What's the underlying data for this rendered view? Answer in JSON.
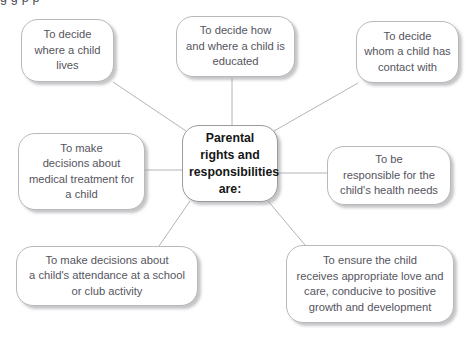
{
  "diagram": {
    "clipped_header_text": "g g p p",
    "center": {
      "id": "center",
      "label": "Parental\nrights and\nresponsibilities\nare:",
      "x": 182,
      "y": 125,
      "width": 96,
      "height": 77
    },
    "nodes": [
      {
        "id": "decide-where-child-lives",
        "label": "To decide\nwhere a child\nlives",
        "x": 21,
        "y": 19,
        "width": 93,
        "height": 63
      },
      {
        "id": "decide-how-where-educated",
        "label": "To decide how\nand where a child is\neducated",
        "x": 176,
        "y": 16,
        "width": 119,
        "height": 61
      },
      {
        "id": "decide-contact-with",
        "label": "To decide\nwhom a child has\ncontact with",
        "x": 356,
        "y": 21,
        "width": 103,
        "height": 62
      },
      {
        "id": "medical-treatment-decisions",
        "label": "To make\ndecisions about\nmedical treatment for\na child",
        "x": 18,
        "y": 133,
        "width": 127,
        "height": 77
      },
      {
        "id": "responsible-health-needs",
        "label": "To be\nresponsible for the\nchild's health needs",
        "x": 327,
        "y": 146,
        "width": 124,
        "height": 59
      },
      {
        "id": "school-club-attendance",
        "label": "To make decisions about\na child's attendance at a school\nor club activity",
        "x": 16,
        "y": 246,
        "width": 182,
        "height": 60
      },
      {
        "id": "ensure-love-and-care",
        "label": "To ensure the child\nreceives appropriate love and\ncare, conducive to positive\ngrowth and development",
        "x": 286,
        "y": 245,
        "width": 168,
        "height": 78
      }
    ],
    "connectors": [
      {
        "id": "center-to-decide-where-child-lives",
        "x1": 186,
        "y1": 131,
        "x2": 113,
        "y2": 82
      },
      {
        "id": "center-to-decide-how-where-educated",
        "x1": 232,
        "y1": 125,
        "x2": 232,
        "y2": 78
      },
      {
        "id": "center-to-decide-contact-with",
        "x1": 274,
        "y1": 131,
        "x2": 358,
        "y2": 83
      },
      {
        "id": "center-to-medical-treatment-decisions",
        "x1": 182,
        "y1": 170,
        "x2": 145,
        "y2": 170
      },
      {
        "id": "center-to-responsible-health-needs",
        "x1": 278,
        "y1": 173,
        "x2": 327,
        "y2": 173
      },
      {
        "id": "center-to-school-club-attendance",
        "x1": 190,
        "y1": 201,
        "x2": 159,
        "y2": 246
      },
      {
        "id": "center-to-ensure-love-and-care",
        "x1": 268,
        "y1": 201,
        "x2": 305,
        "y2": 245
      }
    ],
    "style": {
      "line_color": "#b4b4b8",
      "box_border_color": "#b9b9bd",
      "box_fill": "#ffffff",
      "text_color": "#55555e",
      "center_text_color": "#161616",
      "shadow_color": "#96969b",
      "background": "#ffffff"
    }
  }
}
